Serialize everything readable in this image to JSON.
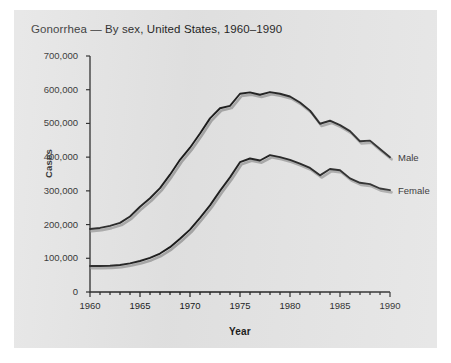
{
  "figure": {
    "background_color": "#e2e2e2",
    "page_color": "#ffffff",
    "line_color": "#1a1a1a",
    "shadow_color": "#9a9a9a"
  },
  "chart_data": {
    "type": "line",
    "title": "Gonorrhea — By sex, United States, 1960–1990",
    "xlabel": "Year",
    "ylabel": "Cases",
    "xlim": [
      1960,
      1990
    ],
    "ylim": [
      0,
      700000
    ],
    "grid": false,
    "legend_position": "inline-right-end-of-line",
    "y_ticks": [
      0,
      100000,
      200000,
      300000,
      400000,
      500000,
      600000,
      700000
    ],
    "y_tick_labels": [
      "0",
      "100,000",
      "200,000",
      "300,000",
      "400,000",
      "500,000",
      "600,000",
      "700,000"
    ],
    "x_ticks": [
      1960,
      1965,
      1970,
      1975,
      1980,
      1985,
      1990
    ],
    "x_tick_labels": [
      "1960",
      "1965",
      "1970",
      "1975",
      "1980",
      "1985",
      "1990"
    ],
    "x_minor_tick_interval": 1,
    "x": [
      1960,
      1961,
      1962,
      1963,
      1964,
      1965,
      1966,
      1967,
      1968,
      1969,
      1970,
      1971,
      1972,
      1973,
      1974,
      1975,
      1976,
      1977,
      1978,
      1979,
      1980,
      1981,
      1982,
      1983,
      1984,
      1985,
      1986,
      1987,
      1988,
      1989,
      1990
    ],
    "series": [
      {
        "name": "Male",
        "label": "Male",
        "values": [
          187000,
          190000,
          196000,
          205000,
          224000,
          253000,
          278000,
          308000,
          348000,
          392000,
          428000,
          470000,
          515000,
          545000,
          552000,
          588000,
          592000,
          585000,
          593000,
          588000,
          580000,
          562000,
          538000,
          499000,
          508000,
          495000,
          477000,
          447000,
          449000,
          424000,
          400000
        ]
      },
      {
        "name": "Female",
        "label": "Female",
        "values": [
          77000,
          77000,
          78000,
          80000,
          85000,
          92000,
          101000,
          114000,
          133000,
          158000,
          185000,
          220000,
          257000,
          300000,
          340000,
          385000,
          396000,
          390000,
          406000,
          400000,
          392000,
          381000,
          368000,
          346000,
          365000,
          361000,
          337000,
          324000,
          320000,
          307000,
          302000
        ]
      }
    ]
  }
}
